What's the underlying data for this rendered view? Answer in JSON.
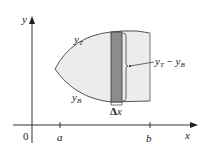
{
  "figure": {
    "colors": {
      "region_fill": "#ececec",
      "region_outline": "#555555",
      "strip_fill": "#8c8c8c",
      "strip_outline": "#333333",
      "axis": "#333333",
      "text": "#222222"
    },
    "axes": {
      "x_label": "x",
      "y_label": "y",
      "origin_label": "0",
      "ticks": [
        {
          "label": "a"
        },
        {
          "label": "b"
        }
      ]
    },
    "curves": {
      "top_label_base": "y",
      "top_label_sub": "T",
      "bottom_label_base": "y",
      "bottom_label_sub": "B"
    },
    "strip": {
      "height_label_base1": "y",
      "height_label_sub1": "T",
      "height_label_minus": " − ",
      "height_label_base2": "y",
      "height_label_sub2": "B",
      "width_label_delta": "Δ",
      "width_label_var": "x"
    }
  }
}
